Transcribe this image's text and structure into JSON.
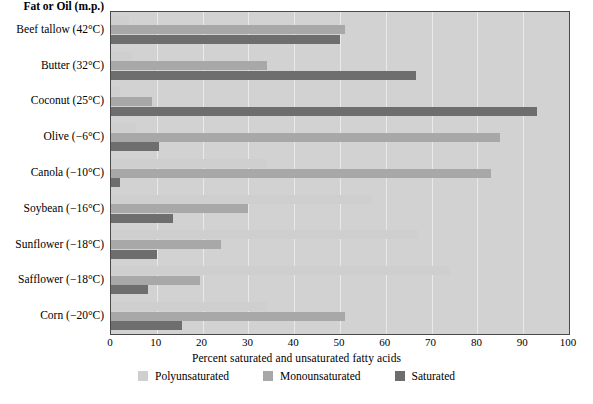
{
  "chart_data": {
    "type": "bar",
    "orientation": "horizontal",
    "title": "",
    "header_label": "Fat or Oil (m.p.)",
    "xlabel": "Percent saturated and unsaturated fatty acids",
    "ylabel": "",
    "xlim": [
      0,
      100
    ],
    "xticks": [
      0,
      10,
      20,
      30,
      40,
      50,
      60,
      70,
      80,
      90,
      100
    ],
    "xtick_labels": [
      "0",
      "10",
      "20",
      "30",
      "40",
      "50",
      "60",
      "70",
      "80",
      "90",
      "100"
    ],
    "grid": true,
    "grid_axis": "x",
    "legend_position": "bottom",
    "categories": [
      "Beef tallow (42°C)",
      "Butter (32°C)",
      "Coconut (25°C)",
      "Olive (−6°C)",
      "Canola (−10°C)",
      "Soybean (−16°C)",
      "Sunflower (−18°C)",
      "Safflower (−18°C)",
      "Corn (−20°C)"
    ],
    "series": [
      {
        "name": "Polyunsaturated",
        "color": "#cfcfcf",
        "values": [
          4,
          4.5,
          2,
          5.5,
          34,
          57,
          67,
          74,
          34
        ]
      },
      {
        "name": "Monounsaturated",
        "color": "#a8a8a8",
        "values": [
          51,
          34,
          9,
          85,
          83,
          30,
          24,
          19.5,
          51
        ]
      },
      {
        "name": "Saturated",
        "color": "#6e6e6e",
        "values": [
          50,
          66.5,
          93,
          10.5,
          2,
          13.5,
          10,
          8,
          15.5
        ]
      }
    ]
  },
  "colors": {
    "plot_background": "#d2d2d2",
    "gridline": "#e9e9e9",
    "plot_border": "#4a4a4a",
    "page_background": "#ffffff",
    "text": "#000000"
  }
}
